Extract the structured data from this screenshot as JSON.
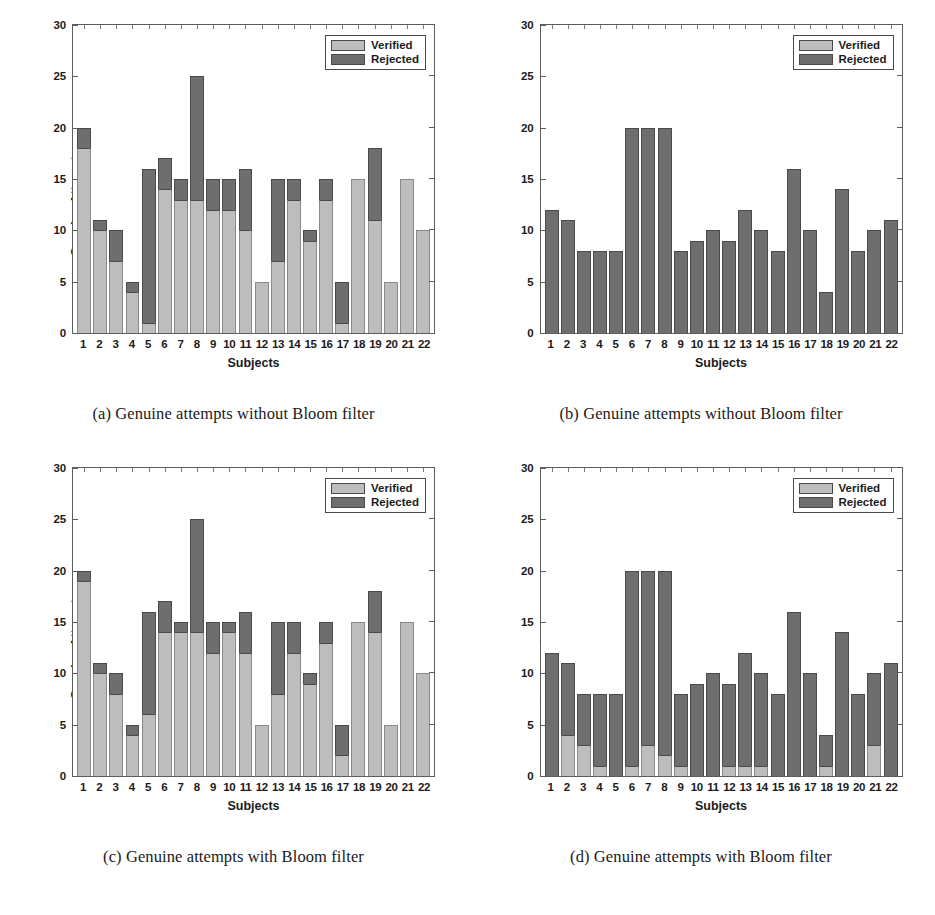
{
  "figure": {
    "subjects": [
      "1",
      "2",
      "3",
      "4",
      "5",
      "6",
      "7",
      "8",
      "9",
      "10",
      "11",
      "12",
      "13",
      "14",
      "15",
      "16",
      "17",
      "18",
      "19",
      "20",
      "21",
      "22"
    ],
    "legend": {
      "verified_label": "Verified",
      "rejected_label": "Rejected"
    },
    "colors": {
      "verified": "#bdbdbd",
      "rejected": "#6e6e6e",
      "axis": "#5d5d5d",
      "text": "#1b1b1b"
    },
    "panels": [
      {
        "id": "a",
        "caption": "(a) Genuine attempts without Bloom filter"
      },
      {
        "id": "b",
        "caption": "(b) Genuine attempts without Bloom filter"
      },
      {
        "id": "c",
        "caption": "(c) Genuine attempts with Bloom filter"
      },
      {
        "id": "d",
        "caption": "(d) Genuine attempts with Bloom filter"
      }
    ]
  },
  "chart_data": [
    {
      "type": "bar",
      "panel": "a",
      "title": "(a) Genuine attempts without Bloom filter",
      "stacked": true,
      "xlabel": "Subjects",
      "ylabel": "Genuine Attempts",
      "ylim": [
        0,
        30
      ],
      "yticks": [
        0,
        5,
        10,
        15,
        20,
        25,
        30
      ],
      "grid": false,
      "legend_position": "top-right",
      "categories": [
        "1",
        "2",
        "3",
        "4",
        "5",
        "6",
        "7",
        "8",
        "9",
        "10",
        "11",
        "12",
        "13",
        "14",
        "15",
        "16",
        "17",
        "18",
        "19",
        "20",
        "21",
        "22"
      ],
      "totals": [
        20,
        11,
        10,
        5,
        16,
        17,
        15,
        25,
        15,
        15,
        16,
        5,
        15,
        15,
        10,
        15,
        5,
        15,
        18,
        5,
        15,
        10
      ],
      "series": [
        {
          "name": "Verified",
          "values": [
            18,
            10,
            7,
            4,
            1,
            14,
            13,
            13,
            12,
            12,
            10,
            5,
            7,
            13,
            9,
            13,
            1,
            15,
            11,
            5,
            15,
            10
          ]
        },
        {
          "name": "Rejected",
          "values": [
            2,
            1,
            3,
            1,
            15,
            3,
            2,
            12,
            3,
            3,
            6,
            0,
            8,
            2,
            1,
            2,
            4,
            0,
            7,
            0,
            0,
            0
          ]
        }
      ]
    },
    {
      "type": "bar",
      "panel": "b",
      "title": "(b) Genuine attempts without Bloom filter",
      "stacked": true,
      "xlabel": "Subjects",
      "ylabel": "Imposter Attempts",
      "ylim": [
        0,
        30
      ],
      "yticks": [
        0,
        5,
        10,
        15,
        20,
        25,
        30
      ],
      "grid": false,
      "legend_position": "top-right",
      "categories": [
        "1",
        "2",
        "3",
        "4",
        "5",
        "6",
        "7",
        "8",
        "9",
        "10",
        "11",
        "12",
        "13",
        "14",
        "15",
        "16",
        "17",
        "18",
        "19",
        "20",
        "21",
        "22"
      ],
      "totals": [
        12,
        11,
        8,
        8,
        8,
        20,
        20,
        20,
        8,
        9,
        10,
        9,
        12,
        10,
        8,
        16,
        10,
        4,
        14,
        8,
        10,
        11
      ],
      "series": [
        {
          "name": "Verified",
          "values": [
            0,
            0,
            0,
            0,
            0,
            0,
            0,
            0,
            0,
            0,
            0,
            0,
            0,
            0,
            0,
            0,
            0,
            0,
            0,
            0,
            0,
            0
          ]
        },
        {
          "name": "Rejected",
          "values": [
            12,
            11,
            8,
            8,
            8,
            20,
            20,
            20,
            8,
            9,
            10,
            9,
            12,
            10,
            8,
            16,
            10,
            4,
            14,
            8,
            10,
            11
          ]
        }
      ]
    },
    {
      "type": "bar",
      "panel": "c",
      "title": "(c) Genuine attempts with Bloom filter",
      "stacked": true,
      "xlabel": "Subjects",
      "ylabel": "Genuine Attempts",
      "ylim": [
        0,
        30
      ],
      "yticks": [
        0,
        5,
        10,
        15,
        20,
        25,
        30
      ],
      "grid": false,
      "legend_position": "top-right",
      "categories": [
        "1",
        "2",
        "3",
        "4",
        "5",
        "6",
        "7",
        "8",
        "9",
        "10",
        "11",
        "12",
        "13",
        "14",
        "15",
        "16",
        "17",
        "18",
        "19",
        "20",
        "21",
        "22"
      ],
      "totals": [
        20,
        11,
        10,
        5,
        16,
        17,
        15,
        25,
        15,
        15,
        16,
        5,
        15,
        15,
        10,
        15,
        5,
        15,
        18,
        5,
        15,
        10
      ],
      "series": [
        {
          "name": "Verified",
          "values": [
            19,
            10,
            8,
            4,
            6,
            14,
            14,
            14,
            12,
            14,
            12,
            5,
            8,
            12,
            9,
            13,
            2,
            15,
            14,
            5,
            15,
            10
          ]
        },
        {
          "name": "Rejected",
          "values": [
            1,
            1,
            2,
            1,
            10,
            3,
            1,
            11,
            3,
            1,
            4,
            0,
            7,
            3,
            1,
            2,
            3,
            0,
            4,
            0,
            0,
            0
          ]
        }
      ]
    },
    {
      "type": "bar",
      "panel": "d",
      "title": "(d) Genuine attempts with Bloom filter",
      "stacked": true,
      "xlabel": "Subjects",
      "ylabel": "Imposter Attempts",
      "ylim": [
        0,
        30
      ],
      "yticks": [
        0,
        5,
        10,
        15,
        20,
        25,
        30
      ],
      "grid": false,
      "legend_position": "top-right",
      "categories": [
        "1",
        "2",
        "3",
        "4",
        "5",
        "6",
        "7",
        "8",
        "9",
        "10",
        "11",
        "12",
        "13",
        "14",
        "15",
        "16",
        "17",
        "18",
        "19",
        "20",
        "21",
        "22"
      ],
      "totals": [
        12,
        11,
        8,
        8,
        8,
        20,
        20,
        20,
        8,
        9,
        10,
        9,
        12,
        10,
        8,
        16,
        10,
        4,
        14,
        8,
        10,
        11
      ],
      "series": [
        {
          "name": "Verified",
          "values": [
            0,
            4,
            3,
            1,
            0,
            1,
            3,
            2,
            1,
            0,
            0,
            1,
            1,
            1,
            0,
            0,
            0,
            1,
            0,
            0,
            3,
            0
          ]
        },
        {
          "name": "Rejected",
          "values": [
            12,
            7,
            5,
            7,
            8,
            19,
            17,
            18,
            7,
            9,
            10,
            8,
            11,
            9,
            8,
            16,
            10,
            3,
            14,
            8,
            7,
            11
          ]
        }
      ]
    }
  ]
}
